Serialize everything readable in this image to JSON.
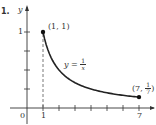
{
  "problem_label": "1.",
  "chart_data": {
    "type": "line",
    "title": "",
    "xlabel": "x",
    "ylabel": "y",
    "function": "y = 1/x",
    "curve_label": {
      "lhs": "y =",
      "num": "1",
      "den": "x"
    },
    "x_range": [
      1,
      7
    ],
    "xlim": [
      0,
      7.5
    ],
    "ylim": [
      0,
      1.2
    ],
    "x": [
      1,
      1.5,
      2,
      2.5,
      3,
      3.5,
      4,
      4.5,
      5,
      5.5,
      6,
      6.5,
      7
    ],
    "values": [
      1,
      0.6667,
      0.5,
      0.4,
      0.3333,
      0.2857,
      0.25,
      0.2222,
      0.2,
      0.1818,
      0.1667,
      0.1538,
      0.1429
    ],
    "x_ticks": [
      1,
      2,
      3,
      4,
      5,
      6,
      7
    ],
    "x_tick_labels": {
      "origin": "0",
      "one": "1",
      "seven": "7"
    },
    "y_ticks": [
      0.25,
      0.5,
      0.75,
      1
    ],
    "y_tick_labels": {
      "one": "1"
    },
    "points": [
      {
        "label": "(1, 1)",
        "x": 1,
        "y": 1
      },
      {
        "label_prefix": "(7,",
        "num": "1",
        "den": "7",
        "label_suffix": ")",
        "x": 7,
        "y": 0.142857
      }
    ],
    "annotations": [
      "dashed vertical line at x = 1"
    ],
    "grid": false,
    "legend": "none"
  }
}
